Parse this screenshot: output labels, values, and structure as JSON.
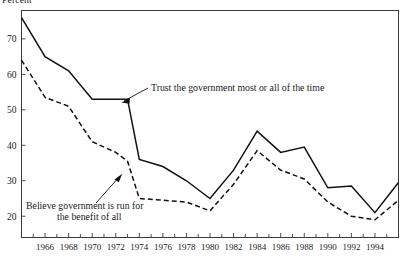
{
  "axis_title": "Percent",
  "annotations": {
    "solid": "Trust the government most or all of the time",
    "dashed_line1": "Believe government is run for",
    "dashed_line2": "the benefit of all"
  },
  "chart_data": {
    "type": "line",
    "title": "",
    "subtitle": "",
    "xlabel": "",
    "ylabel": "Percent",
    "grid": false,
    "legend": "annotated-inline",
    "xlim": [
      1964,
      1996
    ],
    "ylim": [
      14,
      78
    ],
    "yticks": [
      20,
      30,
      40,
      50,
      60,
      70
    ],
    "ytick_labels": [
      "20",
      "30",
      "40",
      "50",
      "60",
      "70"
    ],
    "xticks": [
      1966,
      1968,
      1970,
      1972,
      1974,
      1976,
      1978,
      1980,
      1982,
      1984,
      1986,
      1988,
      1990,
      1992,
      1994
    ],
    "xtick_labels": [
      "1966",
      "1968",
      "1970",
      "1972",
      "1974",
      "1976",
      "1978",
      "1980",
      "1982",
      "1984",
      "1986",
      "1988",
      "1990",
      "1992",
      "1994"
    ],
    "minor_xticks": [
      1965,
      1967,
      1969,
      1971,
      1973,
      1975,
      1977,
      1979,
      1981,
      1983,
      1985,
      1987,
      1989,
      1991,
      1993,
      1995
    ],
    "series": [
      {
        "name": "Trust the government most or all of the time",
        "style": "solid",
        "x": [
          1964,
          1966,
          1968,
          1970,
          1972,
          1973,
          1974,
          1976,
          1978,
          1980,
          1982,
          1984,
          1986,
          1988,
          1990,
          1992,
          1994,
          1996
        ],
        "values": [
          76,
          65,
          61,
          53,
          53,
          53,
          36,
          34,
          30,
          25,
          33,
          44,
          38,
          39.5,
          28,
          28.5,
          21,
          29.5
        ]
      },
      {
        "name": "Believe government is run for the benefit of all",
        "style": "dashed",
        "x": [
          1964,
          1966,
          1968,
          1970,
          1972,
          1973,
          1974,
          1976,
          1978,
          1980,
          1982,
          1984,
          1986,
          1988,
          1990,
          1992,
          1994,
          1996
        ],
        "values": [
          64,
          53.5,
          51,
          41,
          38,
          35.5,
          25,
          24.5,
          24,
          21.5,
          29,
          38.5,
          33,
          30.5,
          24,
          20,
          19,
          24.5
        ]
      }
    ]
  },
  "colors": {
    "line": "#111111",
    "frame": "#3a3a3a",
    "background": "#ffffff"
  }
}
